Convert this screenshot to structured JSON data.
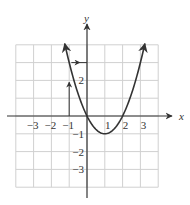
{
  "chart_data": {
    "type": "line",
    "title": "",
    "xlabel": "x",
    "ylabel": "y",
    "function": "y = x^2 - 2x",
    "xlim": [
      -4,
      4
    ],
    "ylim": [
      -4,
      4
    ],
    "grid": true,
    "x_ticks": [
      {
        "value": -3,
        "label": "−3"
      },
      {
        "value": -2,
        "label": "−2"
      },
      {
        "value": -1,
        "label": "−1"
      },
      {
        "value": 1,
        "label": "1"
      },
      {
        "value": 2,
        "label": "2"
      },
      {
        "value": 3,
        "label": "3"
      }
    ],
    "y_ticks": [
      {
        "value": 2,
        "label": "2"
      },
      {
        "value": -1,
        "label": "−1"
      },
      {
        "value": -2,
        "label": "−2"
      },
      {
        "value": -3,
        "label": "−3"
      }
    ],
    "series": [
      {
        "name": "parabola",
        "x": [
          -1.25,
          -1,
          0,
          1,
          2,
          3,
          3.25
        ],
        "y": [
          4.0625,
          3,
          0,
          -1,
          0,
          3,
          4.0625
        ]
      }
    ],
    "annotations": [
      {
        "type": "arrow",
        "from": [
          -1,
          0
        ],
        "to": [
          -1,
          3
        ],
        "description": "vertical arrow from x = -1 up to the curve"
      },
      {
        "type": "arrow",
        "from": [
          -1,
          3
        ],
        "to": [
          0,
          3
        ],
        "description": "horizontal arrow from the curve to the y-axis at y = 3"
      }
    ],
    "colors": {
      "curve": "#333333",
      "axes": "#333333",
      "grid": "#d0d0d0",
      "background": "#ffffff"
    }
  }
}
